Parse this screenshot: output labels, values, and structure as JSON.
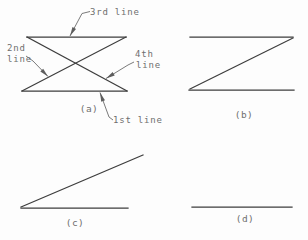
{
  "colors": {
    "background": "#fdfdfd",
    "line": "#3d3d3d",
    "leader": "#6b6b6b",
    "text": "#6f6f6f"
  },
  "labels": {
    "first": "1st line",
    "second_row1": "2nd",
    "second_row2": "line",
    "third": "3rd line",
    "fourth_row1": "4th",
    "fourth_row2": "line"
  },
  "captions": {
    "a": "(a)",
    "b": "(b)",
    "c": "(c)",
    "d": "(d)"
  },
  "diagram": {
    "figures": [
      {
        "id": "a",
        "lines": [
          {
            "name": "first-line",
            "x1": 22,
            "y1": 91,
            "x2": 127,
            "y2": 91
          },
          {
            "name": "second-line",
            "x1": 126,
            "y1": 37,
            "x2": 22,
            "y2": 91
          },
          {
            "name": "third-line",
            "x1": 27,
            "y1": 37,
            "x2": 126,
            "y2": 37
          },
          {
            "name": "fourth-line",
            "x1": 27,
            "y1": 37,
            "x2": 127,
            "y2": 91
          }
        ],
        "leaders": [
          {
            "name": "leader-third-line",
            "points": [
              [
                90,
                11.5
              ],
              [
                82,
                13.5
              ],
              [
                70,
                36
              ]
            ]
          },
          {
            "name": "leader-second-line",
            "points": [
              [
                26,
                56
              ],
              [
                33,
                61
              ],
              [
                48,
                76.5
              ]
            ]
          },
          {
            "name": "leader-fourth-line",
            "points": [
              [
                134,
                62
              ],
              [
                128,
                65
              ],
              [
                106,
                78.5
              ]
            ]
          },
          {
            "name": "leader-first-line",
            "points": [
              [
                113,
                120
              ],
              [
                109,
                117
              ],
              [
                100,
                92.5
              ]
            ]
          }
        ]
      },
      {
        "id": "b",
        "lines": [
          {
            "name": "top-line",
            "x1": 190,
            "y1": 37,
            "x2": 293,
            "y2": 37
          },
          {
            "name": "diagonal-line",
            "x1": 293,
            "y1": 38,
            "x2": 190,
            "y2": 89
          },
          {
            "name": "bottom-line",
            "x1": 189,
            "y1": 90,
            "x2": 294,
            "y2": 90
          }
        ],
        "leaders": []
      },
      {
        "id": "c",
        "lines": [
          {
            "name": "diagonal-line",
            "x1": 21,
            "y1": 207,
            "x2": 143,
            "y2": 155
          },
          {
            "name": "horizontal-line",
            "x1": 21,
            "y1": 208,
            "x2": 128,
            "y2": 208
          }
        ],
        "leaders": []
      },
      {
        "id": "d",
        "lines": [
          {
            "name": "horizontal-line",
            "x1": 192,
            "y1": 207,
            "x2": 292,
            "y2": 207
          }
        ],
        "leaders": []
      }
    ]
  }
}
